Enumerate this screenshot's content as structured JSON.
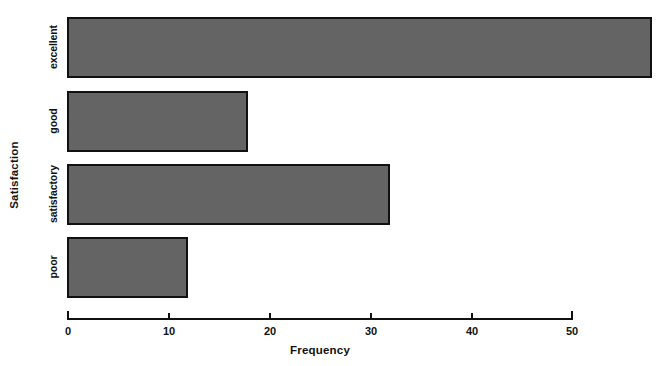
{
  "chart_data": {
    "type": "bar",
    "orientation": "horizontal",
    "title": "",
    "xlabel": "Frequency",
    "ylabel": "Satisfaction",
    "categories": [
      "poor",
      "satisfactory",
      "good",
      "excellent"
    ],
    "values": [
      12,
      32,
      18,
      58
    ],
    "xlim": [
      0,
      50
    ],
    "xticks": [
      0,
      10,
      20,
      30,
      40,
      50
    ],
    "xtick_labels": [
      "0",
      "10",
      "20",
      "30",
      "40",
      "50"
    ],
    "grid": false,
    "legend": null,
    "bar_color": "#646464",
    "bar_edge_color": "#111111",
    "background_color": "#ffffff",
    "note": "excellent bar extends beyond the plotted x-axis maximum of 50"
  },
  "axis": {
    "x_title": "Frequency",
    "y_title": "Satisfaction",
    "x_tick_labels": [
      "0",
      "10",
      "20",
      "30",
      "40",
      "50"
    ],
    "y_tick_labels": [
      "excellent",
      "good",
      "satisfactory",
      "poor"
    ]
  }
}
